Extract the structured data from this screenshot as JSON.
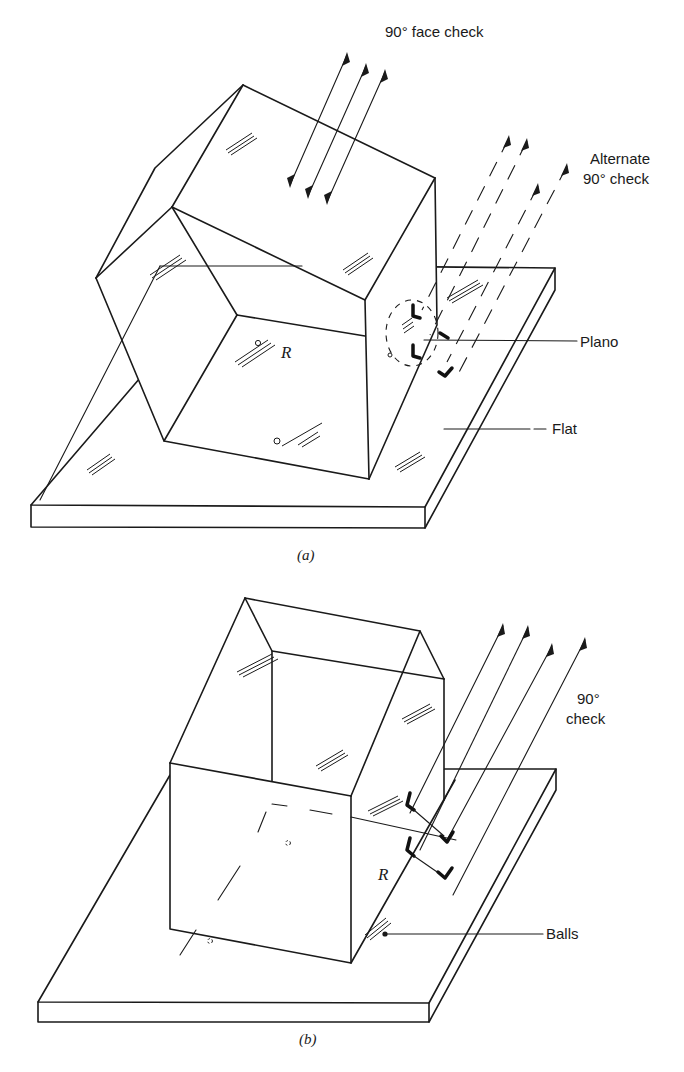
{
  "figure_a": {
    "caption": "(a)",
    "labels": {
      "face_check": "90° face check",
      "alternate_line1": "Alternate",
      "alternate_line2": "90° check",
      "plano": "Plano",
      "flat": "Flat",
      "reflector": "R"
    }
  },
  "figure_b": {
    "caption": "(b)",
    "labels": {
      "check_line1": "90°",
      "check_line2": "check",
      "balls": "Balls",
      "reflector": "R"
    }
  },
  "colors": {
    "ink": "#1a1a1a",
    "background": "#ffffff"
  }
}
